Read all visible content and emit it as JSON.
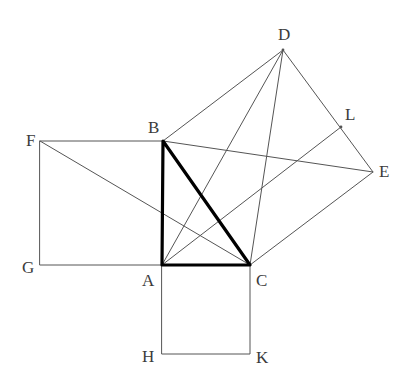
{
  "figure": {
    "background_color": "#ffffff",
    "stroke_color_thin": "#555555",
    "stroke_color_bold": "#000000",
    "label_color": "#3b3b3b",
    "thin_width": 1,
    "bold_width": 3.2,
    "width": 412,
    "height": 391
  },
  "points": {
    "A": {
      "label": "A",
      "x": 162,
      "y": 265,
      "label_x": 142,
      "label_y": 272
    },
    "B": {
      "label": "B",
      "x": 163,
      "y": 141,
      "label_x": 148,
      "label_y": 119
    },
    "C": {
      "label": "C",
      "x": 250,
      "y": 265,
      "label_x": 256,
      "label_y": 272
    },
    "D": {
      "label": "D",
      "x": 283,
      "y": 50,
      "label_x": 278,
      "label_y": 26
    },
    "E": {
      "label": "E",
      "x": 373,
      "y": 172,
      "label_x": 379,
      "label_y": 163
    },
    "F": {
      "label": "F",
      "x": 40,
      "y": 141,
      "label_x": 26,
      "label_y": 132
    },
    "G": {
      "label": "G",
      "x": 40,
      "y": 265,
      "label_x": 22,
      "label_y": 259
    },
    "H": {
      "label": "H",
      "x": 162,
      "y": 354,
      "label_x": 142,
      "label_y": 348
    },
    "K": {
      "label": "K",
      "x": 250,
      "y": 354,
      "label_x": 256,
      "label_y": 349
    },
    "L": {
      "label": "L",
      "x": 341,
      "y": 127,
      "label_x": 345,
      "label_y": 106
    }
  },
  "triangle": {
    "name": "right-triangle-ABC",
    "vertices": [
      "A",
      "B",
      "C"
    ],
    "right_angle_at": "A",
    "emphasis": "bold"
  },
  "squares": [
    {
      "name": "square-on-leg-AB",
      "vertices": [
        "F",
        "B",
        "A",
        "G"
      ],
      "emphasis": "thin"
    },
    {
      "name": "square-on-leg-AC",
      "vertices": [
        "A",
        "C",
        "K",
        "H"
      ],
      "emphasis": "thin"
    },
    {
      "name": "square-on-hypotenuse-BC",
      "vertices": [
        "B",
        "D",
        "E",
        "C"
      ],
      "emphasis": "thin"
    }
  ],
  "construction_lines": [
    {
      "name": "line-F-to-C",
      "from": "F",
      "to": "C",
      "emphasis": "thin"
    },
    {
      "name": "line-A-to-D",
      "from": "A",
      "to": "D",
      "emphasis": "thin"
    },
    {
      "name": "line-A-to-L",
      "from": "A",
      "to": "L",
      "emphasis": "thin"
    },
    {
      "name": "line-D-to-C",
      "from": "D",
      "to": "C",
      "emphasis": "thin"
    },
    {
      "name": "line-B-to-E",
      "from": "B",
      "to": "E",
      "emphasis": "thin"
    }
  ]
}
